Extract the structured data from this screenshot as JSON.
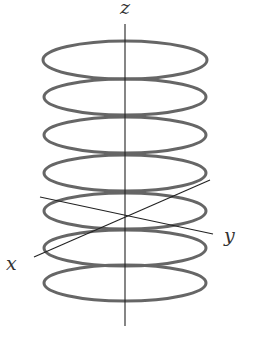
{
  "figure": {
    "type": "3d-coordinate-diagram",
    "colors": {
      "rings": "#666666",
      "axes": "#222222",
      "labels": "#333333",
      "background": "#ffffff"
    },
    "axes": {
      "z": {
        "label": "z"
      },
      "y": {
        "label": "y"
      },
      "x": {
        "label": "x"
      }
    },
    "rings_count": 7
  }
}
